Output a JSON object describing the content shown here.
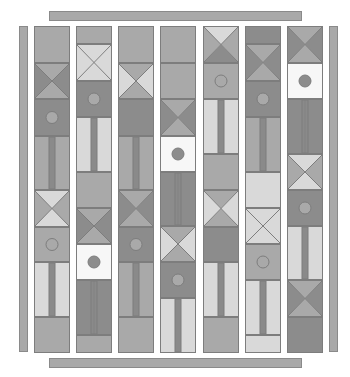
{
  "game": {
    "type": "tile-column-puzzle",
    "bars": {
      "top": {
        "x": 49,
        "y": 11,
        "w": 253,
        "h": 10
      },
      "bottom": {
        "x": 49,
        "y": 358,
        "w": 253,
        "h": 10
      },
      "left": {
        "x": 19,
        "y": 26,
        "w": 9,
        "h": 326
      },
      "right": {
        "x": 329,
        "y": 26,
        "w": 9,
        "h": 326
      }
    },
    "colors": {
      "light": "#d9d9d9",
      "mid": "#a9a9a9",
      "dark": "#8c8c8c",
      "white": "#f7f7f7",
      "outline": "#7d7d7d",
      "pipe": "#8a8a8a"
    },
    "columns": [
      {
        "x": 34,
        "tiles": [
          {
            "kind": "plain",
            "y": 0,
            "h": 37,
            "fill": "mid"
          },
          {
            "kind": "cross",
            "y": 37,
            "h": 36,
            "tb": "mid",
            "lr": "dark"
          },
          {
            "kind": "circle",
            "y": 73,
            "h": 37,
            "fill": "dark",
            "dot": "mid"
          },
          {
            "kind": "pipe",
            "y": 110,
            "h": 54,
            "fill": "mid",
            "double": false
          },
          {
            "kind": "cross",
            "y": 164,
            "h": 37,
            "tb": "light",
            "lr": "mid"
          },
          {
            "kind": "circle",
            "y": 201,
            "h": 35,
            "fill": "mid",
            "dot": "mid"
          },
          {
            "kind": "pipe",
            "y": 236,
            "h": 55,
            "fill": "light",
            "double": false
          },
          {
            "kind": "plain",
            "y": 291,
            "h": 36,
            "fill": "mid"
          }
        ]
      },
      {
        "x": 76,
        "tiles": [
          {
            "kind": "plain",
            "y": 0,
            "h": 18,
            "fill": "mid"
          },
          {
            "kind": "cross",
            "y": 18,
            "h": 37,
            "tb": "light",
            "lr": "light"
          },
          {
            "kind": "circle",
            "y": 55,
            "h": 36,
            "fill": "dark",
            "dot": "mid"
          },
          {
            "kind": "pipe",
            "y": 91,
            "h": 55,
            "fill": "light",
            "double": false
          },
          {
            "kind": "plain",
            "y": 146,
            "h": 36,
            "fill": "mid"
          },
          {
            "kind": "cross",
            "y": 182,
            "h": 36,
            "tb": "mid",
            "lr": "dark"
          },
          {
            "kind": "circle",
            "y": 218,
            "h": 36,
            "fill": "white",
            "dot": "dark"
          },
          {
            "kind": "pipe",
            "y": 254,
            "h": 55,
            "fill": "dark",
            "double": true
          },
          {
            "kind": "plain",
            "y": 309,
            "h": 18,
            "fill": "mid"
          }
        ]
      },
      {
        "x": 118,
        "tiles": [
          {
            "kind": "plain",
            "y": 0,
            "h": 37,
            "fill": "mid"
          },
          {
            "kind": "cross",
            "y": 37,
            "h": 36,
            "tb": "mid",
            "lr": "light"
          },
          {
            "kind": "plain",
            "y": 73,
            "h": 37,
            "fill": "dark"
          },
          {
            "kind": "pipe",
            "y": 110,
            "h": 54,
            "fill": "mid",
            "double": false
          },
          {
            "kind": "cross",
            "y": 164,
            "h": 37,
            "tb": "mid",
            "lr": "dark"
          },
          {
            "kind": "circle",
            "y": 201,
            "h": 35,
            "fill": "dark",
            "dot": "mid"
          },
          {
            "kind": "pipe",
            "y": 236,
            "h": 55,
            "fill": "mid",
            "double": false
          },
          {
            "kind": "plain",
            "y": 291,
            "h": 36,
            "fill": "mid"
          }
        ]
      },
      {
        "x": 160,
        "tiles": [
          {
            "kind": "plain",
            "y": 0,
            "h": 37,
            "fill": "mid"
          },
          {
            "kind": "plain",
            "y": 37,
            "h": 36,
            "fill": "mid"
          },
          {
            "kind": "cross",
            "y": 73,
            "h": 37,
            "tb": "mid",
            "lr": "dark"
          },
          {
            "kind": "circle",
            "y": 110,
            "h": 36,
            "fill": "white",
            "dot": "dark"
          },
          {
            "kind": "pipe",
            "y": 146,
            "h": 54,
            "fill": "dark",
            "double": true
          },
          {
            "kind": "cross",
            "y": 200,
            "h": 36,
            "tb": "mid",
            "lr": "light"
          },
          {
            "kind": "circle",
            "y": 236,
            "h": 36,
            "fill": "dark",
            "dot": "mid"
          },
          {
            "kind": "pipe",
            "y": 272,
            "h": 55,
            "fill": "light",
            "double": false
          }
        ]
      },
      {
        "x": 203,
        "tiles": [
          {
            "kind": "cross",
            "y": 0,
            "h": 37,
            "tb": "light",
            "lr": "mid",
            "bottom": "dark"
          },
          {
            "kind": "circle",
            "y": 37,
            "h": 36,
            "fill": "mid",
            "dot": "mid"
          },
          {
            "kind": "pipe",
            "y": 73,
            "h": 55,
            "fill": "light",
            "double": false
          },
          {
            "kind": "plain",
            "y": 128,
            "h": 36,
            "fill": "mid"
          },
          {
            "kind": "cross",
            "y": 164,
            "h": 37,
            "tb": "mid",
            "lr": "light"
          },
          {
            "kind": "plain",
            "y": 201,
            "h": 35,
            "fill": "dark"
          },
          {
            "kind": "pipe",
            "y": 236,
            "h": 55,
            "fill": "light",
            "double": false
          },
          {
            "kind": "plain",
            "y": 291,
            "h": 36,
            "fill": "mid"
          }
        ]
      },
      {
        "x": 245,
        "tiles": [
          {
            "kind": "plain",
            "y": 0,
            "h": 18,
            "fill": "dark"
          },
          {
            "kind": "cross",
            "y": 18,
            "h": 37,
            "tb": "mid",
            "lr": "dark"
          },
          {
            "kind": "circle",
            "y": 55,
            "h": 36,
            "fill": "dark",
            "dot": "mid"
          },
          {
            "kind": "pipe",
            "y": 91,
            "h": 55,
            "fill": "mid",
            "double": false
          },
          {
            "kind": "plain",
            "y": 146,
            "h": 36,
            "fill": "light"
          },
          {
            "kind": "cross",
            "y": 182,
            "h": 36,
            "tb": "light",
            "lr": "light"
          },
          {
            "kind": "circle",
            "y": 218,
            "h": 36,
            "fill": "mid",
            "dot": "mid"
          },
          {
            "kind": "pipe",
            "y": 254,
            "h": 55,
            "fill": "light",
            "double": false
          },
          {
            "kind": "plain",
            "y": 309,
            "h": 18,
            "fill": "light"
          }
        ]
      },
      {
        "x": 287,
        "tiles": [
          {
            "kind": "cross",
            "y": 0,
            "h": 37,
            "tb": "mid",
            "lr": "dark"
          },
          {
            "kind": "circle",
            "y": 37,
            "h": 36,
            "fill": "white",
            "dot": "dark"
          },
          {
            "kind": "pipe",
            "y": 73,
            "h": 55,
            "fill": "dark",
            "double": true
          },
          {
            "kind": "cross",
            "y": 128,
            "h": 36,
            "tb": "light",
            "lr": "mid"
          },
          {
            "kind": "circle",
            "y": 164,
            "h": 36,
            "fill": "dark",
            "dot": "mid"
          },
          {
            "kind": "pipe",
            "y": 200,
            "h": 54,
            "fill": "light",
            "double": false
          },
          {
            "kind": "cross",
            "y": 254,
            "h": 37,
            "tb": "mid",
            "lr": "dark"
          },
          {
            "kind": "plain",
            "y": 291,
            "h": 36,
            "fill": "dark"
          }
        ]
      }
    ]
  }
}
